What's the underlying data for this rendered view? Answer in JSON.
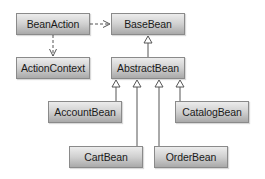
{
  "diagram": {
    "type": "uml-class-diagram",
    "classes": [
      {
        "id": "BeanAction",
        "label": "BeanAction"
      },
      {
        "id": "BaseBean",
        "label": "BaseBean"
      },
      {
        "id": "ActionContext",
        "label": "ActionContext"
      },
      {
        "id": "AbstractBean",
        "label": "AbstractBean"
      },
      {
        "id": "AccountBean",
        "label": "AccountBean"
      },
      {
        "id": "CatalogBean",
        "label": "CatalogBean"
      },
      {
        "id": "CartBean",
        "label": "CartBean"
      },
      {
        "id": "OrderBean",
        "label": "OrderBean"
      }
    ],
    "relations": [
      {
        "from": "BeanAction",
        "to": "BaseBean",
        "kind": "dependency"
      },
      {
        "from": "BeanAction",
        "to": "ActionContext",
        "kind": "dependency"
      },
      {
        "from": "AbstractBean",
        "to": "BaseBean",
        "kind": "generalization"
      },
      {
        "from": "AccountBean",
        "to": "AbstractBean",
        "kind": "generalization"
      },
      {
        "from": "CartBean",
        "to": "AbstractBean",
        "kind": "generalization"
      },
      {
        "from": "OrderBean",
        "to": "AbstractBean",
        "kind": "generalization"
      },
      {
        "from": "CatalogBean",
        "to": "AbstractBean",
        "kind": "generalization"
      }
    ],
    "colors": {
      "box_top": "#ececec",
      "box_bottom": "#a9a9a9",
      "border": "#8a8a8a",
      "line": "#555555"
    }
  }
}
